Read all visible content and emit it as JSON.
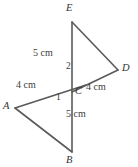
{
  "figure": {
    "kind": "geometry-diagram",
    "stroke_color": "#5a5a5a",
    "text_color": "#3a3a3a",
    "background_color": "#ffffff",
    "vertices": [
      {
        "name": "E",
        "label": "E",
        "x": 72,
        "y": 22,
        "label_x": 66,
        "label_y": 3
      },
      {
        "name": "D",
        "label": "D",
        "x": 118,
        "y": 70,
        "label_x": 122,
        "label_y": 63
      },
      {
        "name": "C",
        "label": "C",
        "x": 72,
        "y": 92,
        "label_x": 75,
        "label_y": 86
      },
      {
        "name": "A",
        "label": "A",
        "x": 15,
        "y": 108,
        "label_x": 3,
        "label_y": 101
      },
      {
        "name": "B",
        "label": "B",
        "x": 72,
        "y": 152,
        "label_x": 66,
        "label_y": 155
      }
    ],
    "segments": [
      {
        "name": "segment-E-B",
        "from": "E",
        "to": "B"
      },
      {
        "name": "segment-E-D",
        "from": "E",
        "to": "D"
      },
      {
        "name": "segment-D-C",
        "from": "D",
        "to": "C"
      },
      {
        "name": "segment-A-C",
        "from": "A",
        "to": "C"
      },
      {
        "name": "segment-A-B",
        "from": "A",
        "to": "B"
      }
    ],
    "measure_labels": [
      {
        "name": "length-EC",
        "text": "5 cm",
        "x": 33,
        "y": 48
      },
      {
        "name": "length-AC",
        "text": "4 cm",
        "x": 16,
        "y": 80
      },
      {
        "name": "length-CD",
        "text": "4 cm",
        "x": 86,
        "y": 82
      },
      {
        "name": "length-CB",
        "text": "5 cm",
        "x": 66,
        "y": 109
      }
    ],
    "angle_labels": [
      {
        "name": "angle-2",
        "text": "2",
        "x": 66,
        "y": 62
      },
      {
        "name": "angle-1",
        "text": "1",
        "x": 56,
        "y": 93
      }
    ]
  }
}
